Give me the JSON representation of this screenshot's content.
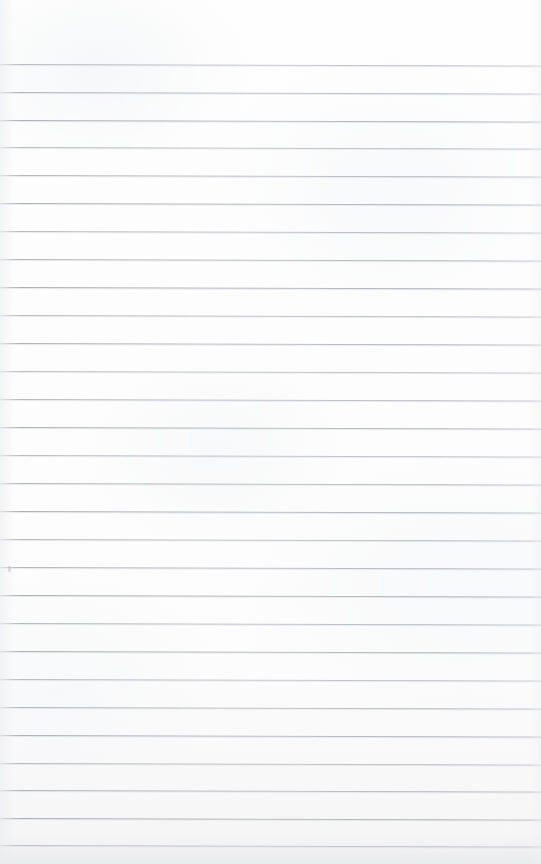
{
  "document": {
    "kind": "scanned-ruled-notebook-page",
    "title": "Ruled notebook page",
    "content_text": "",
    "has_handwriting": false,
    "has_printed_text": false
  },
  "page": {
    "width": 541,
    "height": 864,
    "paper_color": "#fdfdfd",
    "edge_shadow_color": "#f2f2f3"
  },
  "ruling": {
    "line_color": "#a8acb4",
    "line_thickness_px": 1,
    "line_spacing_px": 27.8,
    "first_line_y": 64,
    "line_count": 29,
    "skew_degrees": 0.16,
    "left_margin_rule": false,
    "top_margin_px": 64,
    "line_y_positions": [
      64,
      92,
      120,
      147,
      175,
      203,
      231,
      259,
      287,
      315,
      343,
      371,
      399,
      427,
      455,
      483,
      511,
      539,
      567,
      595,
      623,
      651,
      679,
      707,
      735,
      763,
      790,
      818,
      845
    ]
  },
  "marks": [
    {
      "name": "scan-speck",
      "x": 8,
      "y": 566,
      "width": 3,
      "height": 6,
      "color": "#b2b4ba"
    }
  ]
}
